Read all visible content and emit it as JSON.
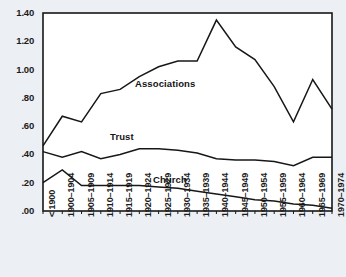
{
  "chart_data": {
    "type": "line",
    "title": "",
    "subtitle": "",
    "xlabel": "",
    "ylabel": "",
    "ylim": [
      0.0,
      1.4
    ],
    "yticks": [
      "1.40",
      "1.20",
      "1.00",
      ".80",
      ".60",
      ".40",
      ".20",
      ".00"
    ],
    "ytick_values": [
      1.4,
      1.2,
      1.0,
      0.8,
      0.6,
      0.4,
      0.2,
      0.0
    ],
    "grid": false,
    "legend_position": "inline-labels",
    "categories": [
      "< 1900",
      "1900–1904",
      "1905–1909",
      "1910–1914",
      "1915–1919",
      "1920–1924",
      "1925–1929",
      "1930–1934",
      "1935–1939",
      "1940–1944",
      "1945–1949",
      "1950–1954",
      "1955–1959",
      "1960–1964",
      "1965–1969",
      "1970–1974"
    ],
    "series": [
      {
        "name": "Associations",
        "values": [
          0.46,
          0.67,
          0.63,
          0.83,
          0.86,
          0.95,
          1.02,
          1.06,
          1.06,
          1.35,
          1.16,
          1.07,
          0.88,
          0.63,
          0.93,
          0.72
        ],
        "label_text": "Associations"
      },
      {
        "name": "Trust",
        "values": [
          0.42,
          0.38,
          0.42,
          0.37,
          0.4,
          0.44,
          0.44,
          0.43,
          0.41,
          0.37,
          0.36,
          0.36,
          0.35,
          0.32,
          0.38,
          0.38
        ],
        "label_text": "Trust"
      },
      {
        "name": "Church",
        "values": [
          0.2,
          0.29,
          0.18,
          0.18,
          0.18,
          0.18,
          0.17,
          0.16,
          0.14,
          0.12,
          0.1,
          0.08,
          0.07,
          0.05,
          0.04,
          0.02
        ],
        "label_text": "Church"
      }
    ]
  },
  "colors": {
    "line": "#171717",
    "axis": "#171717",
    "background": "#eceff4",
    "plot_background": "#ffffff",
    "text": "#1b1b1b"
  }
}
